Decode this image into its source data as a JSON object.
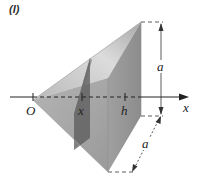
{
  "figure": {
    "tag": "(I)",
    "labels": {
      "origin": "O",
      "slice_position": "x",
      "height": "h",
      "axis": "x",
      "base_height": "a",
      "base_depth": "a"
    },
    "colors": {
      "top_face": "#cfcfcf",
      "front_face": "#a9a9a9",
      "lower_face": "#9c9c9c",
      "back_face": "#bdbdbd",
      "slice": "#5e5e5e",
      "axis": "#222222"
    }
  }
}
